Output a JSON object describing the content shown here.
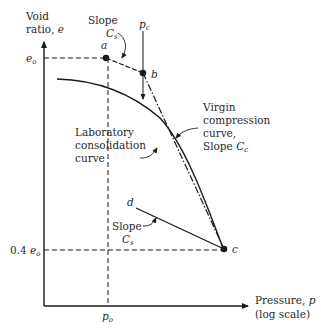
{
  "figure": {
    "type": "consolidation-curve-diagram",
    "y_axis": {
      "label_line1": "Void",
      "label_line2": "ratio, ",
      "label_var": "e"
    },
    "x_axis": {
      "label_line1": "Pressure, ",
      "label_var": "p",
      "label_line2": "(log scale)"
    },
    "y_ticks": [
      {
        "base": "e",
        "sub": "o",
        "prefix": ""
      },
      {
        "base": "e",
        "sub": "o",
        "prefix": "0.4 "
      }
    ],
    "x_ticks": [
      {
        "base": "p",
        "sub": "o"
      }
    ],
    "points": {
      "a": "a",
      "b": "b",
      "c": "c",
      "d": "d"
    },
    "pc_label": {
      "base": "p",
      "sub": "c"
    },
    "annotations": {
      "slope_top_line1": "Slope",
      "slope_top_base": "C",
      "slope_top_sub": "s",
      "virgin_line1": "Virgin",
      "virgin_line2": "compression",
      "virgin_line3": "curve,",
      "virgin_line4_prefix": "Slope ",
      "virgin_base": "C",
      "virgin_sub": "c",
      "lab_line1": "Laboratory",
      "lab_line2": "consolidation",
      "lab_line3": "curve",
      "slope_bottom_line1": "Slope",
      "slope_bottom_base": "C",
      "slope_bottom_sub": "s"
    },
    "colors": {
      "ink": "#1a1a1a",
      "background": "#ffffff"
    }
  }
}
